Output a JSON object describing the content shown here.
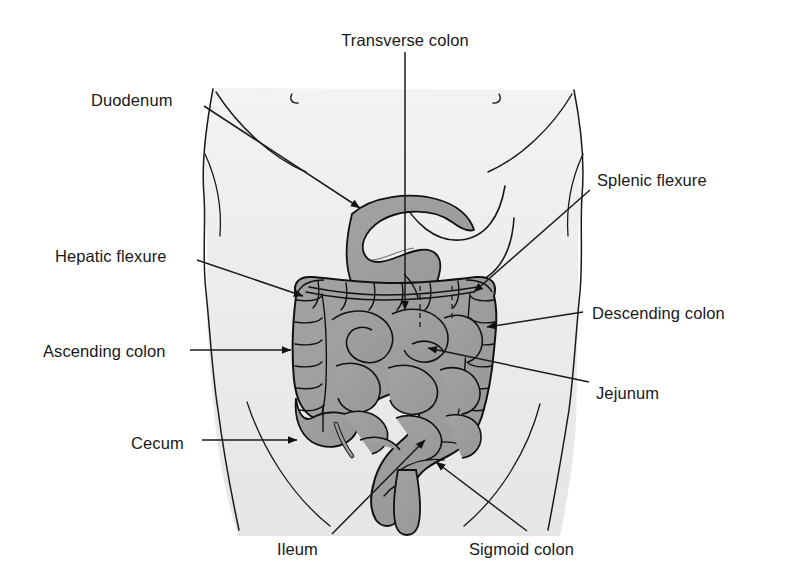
{
  "figure": {
    "type": "medical-illustration",
    "width": 787,
    "height": 579,
    "colors": {
      "background": "#ffffff",
      "body_fill": "#ededed",
      "body_outline": "#1a1a1a",
      "intestine_fill": "#9d9d9d",
      "intestine_shade": "#8a8a8a",
      "intestine_outline": "#111111",
      "leader_line": "#1a1a1a",
      "text": "#191919"
    }
  },
  "labels": [
    {
      "id": "transverse-colon",
      "text": "Transverse colon",
      "align": "center",
      "x": 405,
      "y": 32,
      "leader": {
        "type": "arrow",
        "points": [
          [
            405,
            52
          ],
          [
            405,
            310
          ]
        ]
      }
    },
    {
      "id": "duodenum",
      "text": "Duodenum",
      "align": "left",
      "x": 91,
      "y": 92,
      "leader": {
        "type": "arrow",
        "points": [
          [
            204,
            106
          ],
          [
            360,
            208
          ]
        ]
      }
    },
    {
      "id": "splenic-flexure",
      "text": "Splenic flexure",
      "align": "left",
      "x": 597,
      "y": 172,
      "leader": {
        "type": "arrow",
        "points": [
          [
            590,
            190
          ],
          [
            474,
            292
          ]
        ]
      }
    },
    {
      "id": "hepatic-flexure",
      "text": "Hepatic flexure",
      "align": "left",
      "x": 55,
      "y": 248,
      "leader": {
        "type": "arrow",
        "points": [
          [
            197,
            260
          ],
          [
            303,
            296
          ]
        ]
      }
    },
    {
      "id": "descending-colon",
      "text": "Descending colon",
      "align": "left",
      "x": 592,
      "y": 305,
      "leader": {
        "type": "arrow",
        "points": [
          [
            583,
            312
          ],
          [
            487,
            327
          ]
        ]
      }
    },
    {
      "id": "ascending-colon",
      "text": "Ascending colon",
      "align": "left",
      "x": 43,
      "y": 343,
      "leader": {
        "type": "arrow",
        "points": [
          [
            190,
            350
          ],
          [
            291,
            350
          ]
        ]
      }
    },
    {
      "id": "jejunum",
      "text": "Jejunum",
      "align": "left",
      "x": 596,
      "y": 385,
      "leader": {
        "type": "arrow",
        "points": [
          [
            589,
            382
          ],
          [
            428,
            348
          ]
        ]
      }
    },
    {
      "id": "cecum",
      "text": "Cecum",
      "align": "left",
      "x": 131,
      "y": 435,
      "leader": {
        "type": "arrow",
        "points": [
          [
            202,
            440
          ],
          [
            297,
            440
          ]
        ]
      }
    },
    {
      "id": "ileum",
      "text": "Ileum",
      "align": "left",
      "x": 277,
      "y": 541,
      "leader": {
        "type": "arrow",
        "points": [
          [
            332,
            534
          ],
          [
            425,
            440
          ]
        ]
      }
    },
    {
      "id": "sigmoid-colon",
      "text": "Sigmoid colon",
      "align": "left",
      "x": 469,
      "y": 541,
      "leader": {
        "type": "arrow",
        "points": [
          [
            527,
            531
          ],
          [
            436,
            462
          ]
        ]
      }
    }
  ]
}
